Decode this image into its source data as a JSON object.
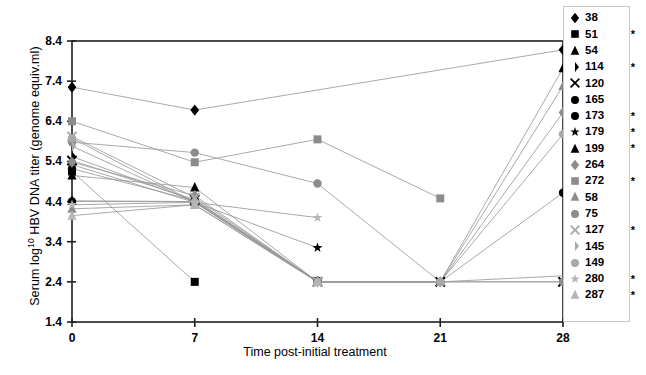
{
  "chart_data": {
    "type": "line",
    "title": "",
    "xlabel": "Time post-initial treatment",
    "ylabel": "Serum log10 HBV DNA titer (genome equiv.ml)",
    "ylabel_base": "Serum log",
    "ylabel_sup": "10",
    "ylabel_rest": " HBV DNA titer (genome equiv.ml)",
    "x": [
      0,
      7,
      14,
      21,
      28
    ],
    "xtick_labels": [
      "0",
      "7",
      "14",
      "21",
      "28"
    ],
    "ytick_labels": [
      "1.4",
      "2.4",
      "3.4",
      "4.4",
      "5.4",
      "6.4",
      "7.4",
      "8.4"
    ],
    "ytick_values": [
      1.4,
      2.4,
      3.4,
      4.4,
      5.4,
      6.4,
      7.4,
      8.4
    ],
    "ylim": [
      1.4,
      8.4
    ],
    "xlim": [
      0,
      28
    ],
    "grid": false,
    "legend_position": "right-outside",
    "series": [
      {
        "name": "38",
        "marker": "diamond",
        "color": "#000000",
        "starred": false,
        "points": [
          {
            "x": 0,
            "y": 7.25
          },
          {
            "x": 7,
            "y": 6.68
          },
          {
            "x": 28,
            "y": 8.18
          }
        ]
      },
      {
        "name": "51",
        "marker": "square",
        "color": "#000000",
        "starred": true,
        "points": [
          {
            "x": 0,
            "y": 5.15
          },
          {
            "x": 7,
            "y": 2.4
          }
        ]
      },
      {
        "name": "54",
        "marker": "triangle",
        "color": "#000000",
        "starred": false,
        "points": [
          {
            "x": 0,
            "y": 5.05
          },
          {
            "x": 7,
            "y": 4.75
          },
          {
            "x": 14,
            "y": 2.4
          },
          {
            "x": 21,
            "y": 2.4
          },
          {
            "x": 28,
            "y": 7.72
          }
        ]
      },
      {
        "name": "114",
        "marker": "halfdiamond",
        "color": "#000000",
        "starred": true,
        "points": [
          {
            "x": 0,
            "y": 5.52
          },
          {
            "x": 7,
            "y": 4.42
          },
          {
            "x": 14,
            "y": 2.42
          }
        ]
      },
      {
        "name": "120",
        "marker": "cross",
        "color": "#000000",
        "starred": false,
        "points": [
          {
            "x": 0,
            "y": 5.42
          },
          {
            "x": 7,
            "y": 4.45
          },
          {
            "x": 14,
            "y": 2.4
          },
          {
            "x": 21,
            "y": 2.4
          },
          {
            "x": 28,
            "y": 2.4
          }
        ]
      },
      {
        "name": "165",
        "marker": "circle",
        "color": "#000000",
        "starred": false,
        "points": [
          {
            "x": 0,
            "y": 5.22
          },
          {
            "x": 7,
            "y": 4.42
          },
          {
            "x": 14,
            "y": 2.42
          }
        ]
      },
      {
        "name": "173",
        "marker": "circle",
        "color": "#000000",
        "starred": true,
        "points": [
          {
            "x": 0,
            "y": 4.4
          },
          {
            "x": 7,
            "y": 4.4
          },
          {
            "x": 14,
            "y": 2.4
          },
          {
            "x": 21,
            "y": 2.4
          },
          {
            "x": 28,
            "y": 4.62
          }
        ]
      },
      {
        "name": "179",
        "marker": "star",
        "color": "#000000",
        "starred": true,
        "points": [
          {
            "x": 0,
            "y": 5.32
          },
          {
            "x": 7,
            "y": 4.38
          },
          {
            "x": 14,
            "y": 3.25
          }
        ]
      },
      {
        "name": "199",
        "marker": "triangle",
        "color": "#000000",
        "starred": true,
        "points": [
          {
            "x": 0,
            "y": 4.42
          },
          {
            "x": 7,
            "y": 4.4
          },
          {
            "x": 14,
            "y": 2.4
          }
        ]
      },
      {
        "name": "264",
        "marker": "diamond",
        "color": "#8c8c8c",
        "starred": false,
        "points": [
          {
            "x": 0,
            "y": 5.38
          },
          {
            "x": 7,
            "y": 4.55
          },
          {
            "x": 14,
            "y": 2.4
          },
          {
            "x": 21,
            "y": 2.4
          },
          {
            "x": 28,
            "y": 6.62
          }
        ]
      },
      {
        "name": "272",
        "marker": "square",
        "color": "#8c8c8c",
        "starred": true,
        "points": [
          {
            "x": 0,
            "y": 6.4
          },
          {
            "x": 7,
            "y": 5.38
          },
          {
            "x": 14,
            "y": 5.95
          },
          {
            "x": 21,
            "y": 4.48
          }
        ]
      },
      {
        "name": "58",
        "marker": "triangle",
        "color": "#8c8c8c",
        "starred": false,
        "points": [
          {
            "x": 0,
            "y": 4.22
          },
          {
            "x": 7,
            "y": 4.32
          },
          {
            "x": 14,
            "y": 2.4
          },
          {
            "x": 21,
            "y": 2.4
          },
          {
            "x": 28,
            "y": 7.28
          }
        ]
      },
      {
        "name": "75",
        "marker": "circle",
        "color": "#8c8c8c",
        "starred": false,
        "points": [
          {
            "x": 0,
            "y": 5.88
          },
          {
            "x": 7,
            "y": 5.62
          },
          {
            "x": 14,
            "y": 4.85
          },
          {
            "x": 21,
            "y": 2.4
          },
          {
            "x": 28,
            "y": 2.4
          }
        ]
      },
      {
        "name": "127",
        "marker": "cross",
        "color": "#a8a8a8",
        "starred": true,
        "points": [
          {
            "x": 0,
            "y": 6.02
          },
          {
            "x": 7,
            "y": 4.5
          },
          {
            "x": 14,
            "y": 2.4
          }
        ]
      },
      {
        "name": "145",
        "marker": "halfdiamond",
        "color": "#a8a8a8",
        "starred": false,
        "points": [
          {
            "x": 0,
            "y": 5.78
          },
          {
            "x": 7,
            "y": 4.38
          },
          {
            "x": 14,
            "y": 2.4
          },
          {
            "x": 21,
            "y": 2.4
          },
          {
            "x": 28,
            "y": 2.55
          }
        ]
      },
      {
        "name": "149",
        "marker": "circle",
        "color": "#a8a8a8",
        "starred": false,
        "points": [
          {
            "x": 0,
            "y": 5.98
          },
          {
            "x": 7,
            "y": 4.38
          },
          {
            "x": 14,
            "y": 2.4
          },
          {
            "x": 21,
            "y": 2.4
          },
          {
            "x": 28,
            "y": 6.08
          }
        ]
      },
      {
        "name": "280",
        "marker": "star",
        "color": "#b5b5b5",
        "starred": true,
        "points": [
          {
            "x": 0,
            "y": 4.32
          },
          {
            "x": 7,
            "y": 4.38
          },
          {
            "x": 14,
            "y": 4.0
          }
        ]
      },
      {
        "name": "287",
        "marker": "triangle",
        "color": "#b5b5b5",
        "starred": true,
        "points": [
          {
            "x": 0,
            "y": 4.05
          },
          {
            "x": 7,
            "y": 4.32
          },
          {
            "x": 14,
            "y": 2.4
          }
        ]
      }
    ]
  },
  "legend": {
    "star_symbol": "*",
    "items": [
      {
        "label": "38"
      },
      {
        "label": "51"
      },
      {
        "label": "54"
      },
      {
        "label": "114"
      },
      {
        "label": "120"
      },
      {
        "label": "165"
      },
      {
        "label": "173"
      },
      {
        "label": "179"
      },
      {
        "label": "199"
      },
      {
        "label": "264"
      },
      {
        "label": "272"
      },
      {
        "label": "58"
      },
      {
        "label": "75"
      },
      {
        "label": "127"
      },
      {
        "label": "145"
      },
      {
        "label": "149"
      },
      {
        "label": "280"
      },
      {
        "label": "287"
      }
    ]
  }
}
